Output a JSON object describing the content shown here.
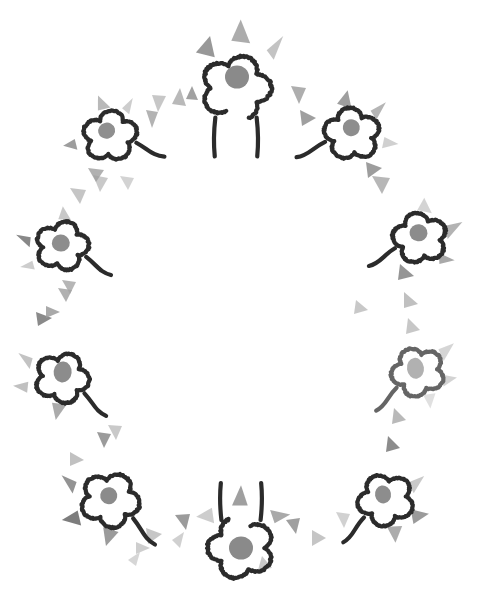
{
  "artwork": {
    "title": "Hand-drawn flower wreath",
    "type": "decorative-illustration",
    "canvas": {
      "width": 489,
      "height": 597,
      "background": "#ffffff"
    },
    "style": {
      "outline_color": "#2b2b2b",
      "outline_width": 4.2,
      "center_dot_color": "#8a8a8a",
      "triangle_color_dark": "#6e6e6e",
      "triangle_color_mid": "#9a9a9a",
      "triangle_color_light": "#c4c4c4"
    },
    "composition": {
      "arrangement": "oval-ring",
      "ring_center_x": 244,
      "ring_center_y": 305,
      "ring_radius_x": 180,
      "ring_radius_y": 245,
      "flower_count": 8,
      "triangle_count": 34
    },
    "flowers": [
      {
        "name": "flower-top-center",
        "cx": 236,
        "cy": 88,
        "scale": 1.18,
        "rotate": 0,
        "opacity": 1,
        "variant": "stemmed",
        "center": {
          "cx": 237,
          "cy": 77,
          "rx": 12,
          "ry": 11.5,
          "color": "#8a8a8a"
        },
        "petal_triangles": [
          {
            "points": "-34,-30 -22,-44 -18,-26",
            "color": "#8d8d8d",
            "opacity": 0.9
          },
          {
            "points": "-4,-40 4,-58 12,-38",
            "color": "#9d9d9d",
            "opacity": 0.85
          },
          {
            "points": "26,-32 40,-44 32,-24",
            "color": "#bdbdbd",
            "opacity": 0.9
          }
        ]
      },
      {
        "name": "flower-upper-left",
        "cx": 110,
        "cy": 136,
        "scale": 0.92,
        "rotate": -14,
        "opacity": 1,
        "variant": "tailed",
        "center": {
          "cx": 108,
          "cy": 130,
          "rx": 8.5,
          "ry": 8,
          "color": "#8f8f8f"
        },
        "petal_triangles": [
          {
            "points": "-38,-6 -52,-2 -38,6",
            "color": "#8c8c8c",
            "opacity": 0.85
          },
          {
            "points": "-6,-30 -2,-46 8,-30",
            "color": "#a8a8a8",
            "opacity": 0.8
          },
          {
            "points": "20,-26 34,-34 26,-18",
            "color": "#bcbcbc",
            "opacity": 0.75
          }
        ]
      },
      {
        "name": "flower-upper-right",
        "cx": 352,
        "cy": 134,
        "scale": 0.95,
        "rotate": 12,
        "opacity": 1,
        "variant": "tailed-mirror",
        "center": {
          "cx": 350,
          "cy": 128,
          "rx": 8.5,
          "ry": 8.5,
          "color": "#8d8d8d"
        },
        "petal_triangles": [
          {
            "points": "-22,-28 -14,-44 -6,-26",
            "color": "#8e8e8e",
            "opacity": 0.85
          },
          {
            "points": "14,-28 28,-40 22,-20",
            "color": "#a2a2a2",
            "opacity": 0.8
          },
          {
            "points": "34,-4 50,0 34,8",
            "color": "#bcbcbc",
            "opacity": 0.7
          }
        ]
      },
      {
        "name": "flower-left-upper-mid",
        "cx": 62,
        "cy": 246,
        "scale": 0.9,
        "rotate": -4,
        "opacity": 1,
        "variant": "tailed",
        "center": {
          "cx": 61,
          "cy": 243,
          "rx": 9,
          "ry": 8.5,
          "color": "#8d8d8d"
        },
        "petal_triangles": [
          {
            "points": "-34,-12 -50,-16 -36,-1",
            "color": "#7b7b7b",
            "opacity": 0.9
          },
          {
            "points": "-34,14 -48,20 -32,24",
            "color": "#c0c0c0",
            "opacity": 0.8
          },
          {
            "points": "-2,-30 4,-44 12,-28",
            "color": "#b0b0b0",
            "opacity": 0.7
          }
        ]
      },
      {
        "name": "flower-right-upper-mid",
        "cx": 420,
        "cy": 238,
        "scale": 0.92,
        "rotate": 6,
        "opacity": 1,
        "variant": "tailed-mirror",
        "center": {
          "cx": 418,
          "cy": 233,
          "rx": 9,
          "ry": 8.5,
          "color": "#8c8c8c"
        },
        "petal_triangles": [
          {
            "points": "26,-16 44,-22 30,-2",
            "color": "#a6a6a6",
            "opacity": 0.85
          },
          {
            "points": "22,14 40,20 24,26",
            "color": "#9a9a9a",
            "opacity": 0.85
          },
          {
            "points": "-6,-30 0,-44 10,-28",
            "color": "#c2c2c2",
            "opacity": 0.7
          }
        ]
      },
      {
        "name": "flower-left-lower-mid",
        "cx": 62,
        "cy": 378,
        "scale": 0.92,
        "rotate": 6,
        "opacity": 1,
        "variant": "tailed",
        "center": {
          "cx": 62,
          "cy": 372,
          "rx": 9,
          "ry": 10.5,
          "color": "#8c8c8c"
        },
        "petal_triangles": [
          {
            "points": "-34,-18 -50,-22 -36,-6",
            "color": "#b4b4b4",
            "opacity": 0.8
          },
          {
            "points": "-36,8 -52,14 -36,20",
            "color": "#b0b0b0",
            "opacity": 0.8
          },
          {
            "points": "-8,28 -2,46 8,28",
            "color": "#9c9c9c",
            "opacity": 0.85
          }
        ]
      },
      {
        "name": "flower-right-lower-mid",
        "cx": 418,
        "cy": 372,
        "scale": 0.9,
        "rotate": -8,
        "opacity": 0.72,
        "variant": "tailed-mirror",
        "center": {
          "cx": 416,
          "cy": 368,
          "rx": 8.5,
          "ry": 10.5,
          "color": "#949494"
        },
        "petal_triangles": [
          {
            "points": "26,-22 44,-26 30,-8",
            "color": "#b8b8b8",
            "opacity": 0.8
          },
          {
            "points": "24,6 42,12 26,20",
            "color": "#b4b4b4",
            "opacity": 0.8
          },
          {
            "points": "2,26 8,42 16,26",
            "color": "#c2c2c2",
            "opacity": 0.7
          }
        ]
      },
      {
        "name": "flower-lower-left",
        "cx": 110,
        "cy": 500,
        "scale": 1.0,
        "rotate": 10,
        "opacity": 1,
        "variant": "tailed",
        "center": {
          "cx": 108,
          "cy": 496,
          "rx": 8.5,
          "ry": 8.5,
          "color": "#8b8b8b"
        },
        "petal_triangles": [
          {
            "points": "-36,-12 -52,-16 -38,0",
            "color": "#878787",
            "opacity": 0.9
          },
          {
            "points": "-30,16 -44,28 -24,30",
            "color": "#6f6f6f",
            "opacity": 0.9
          },
          {
            "points": "-2,28 4,46 14,30",
            "color": "#8a8a8a",
            "opacity": 0.85
          }
        ]
      },
      {
        "name": "flower-lower-right",
        "cx": 386,
        "cy": 500,
        "scale": 0.95,
        "rotate": -10,
        "opacity": 1,
        "variant": "tailed-mirror",
        "center": {
          "cx": 384,
          "cy": 494,
          "rx": 8,
          "ry": 9,
          "color": "#8d8d8d"
        },
        "petal_triangles": [
          {
            "points": "26,-14 44,-18 30,-2",
            "color": "#bcbcbc",
            "opacity": 0.8
          },
          {
            "points": "24,14 42,22 24,30",
            "color": "#8a8a8a",
            "opacity": 0.85
          },
          {
            "points": "-4,28 2,46 12,30",
            "color": "#9e9e9e",
            "opacity": 0.85
          }
        ]
      },
      {
        "name": "flower-bottom-center",
        "cx": 241,
        "cy": 548,
        "scale": 1.12,
        "rotate": 180,
        "opacity": 1,
        "variant": "stemmed",
        "center": {
          "cx": 241,
          "cy": 548,
          "rx": 12,
          "ry": 11.5,
          "color": "#8a8a8a"
        },
        "petal_triangles": [
          {
            "points": "-30,22 -44,30 -26,34",
            "color": "#9a9a9a",
            "opacity": 0.85
          },
          {
            "points": "-6,38 0,56 8,38",
            "color": "#8e8e8e",
            "opacity": 0.85
          },
          {
            "points": "24,22 40,28 26,36",
            "color": "#c0c0c0",
            "opacity": 0.8
          }
        ]
      }
    ],
    "scatter_triangles": [
      {
        "points": "152,95 158,112 166,96",
        "color": "#bdbdbd",
        "opacity": 0.85,
        "name": "scatter-1"
      },
      {
        "points": "172,104 180,88 186,106",
        "color": "#a8a8a8",
        "opacity": 0.8,
        "name": "scatter-2"
      },
      {
        "points": "291,86 299,104 306,88",
        "color": "#a0a0a0",
        "opacity": 0.85,
        "name": "scatter-3"
      },
      {
        "points": "146,110 152,128 158,112",
        "color": "#9a9a9a",
        "opacity": 0.75,
        "name": "scatter-4"
      },
      {
        "points": "300,110 316,118 302,126",
        "color": "#8e8e8e",
        "opacity": 0.85,
        "name": "scatter-5"
      },
      {
        "points": "93,175 100,192 108,178",
        "color": "#bcbcbc",
        "opacity": 0.8,
        "name": "scatter-6"
      },
      {
        "points": "88,168 96,182 104,170",
        "color": "#9e9e9e",
        "opacity": 0.8,
        "name": "scatter-7"
      },
      {
        "points": "372,176 382,194 390,178",
        "color": "#aaaaaa",
        "opacity": 0.85,
        "name": "scatter-8"
      },
      {
        "points": "366,162 382,168 368,178",
        "color": "#8c8c8c",
        "opacity": 0.85,
        "name": "scatter-9"
      },
      {
        "points": "70,188 80,204 86,190",
        "color": "#b6b6b6",
        "opacity": 0.8,
        "name": "scatter-10"
      },
      {
        "points": "400,264 414,276 398,280",
        "color": "#8a8a8a",
        "opacity": 0.9,
        "name": "scatter-11"
      },
      {
        "points": "404,292 418,304 404,308",
        "color": "#b0b0b0",
        "opacity": 0.8,
        "name": "scatter-12"
      },
      {
        "points": "58,288 66,302 72,290",
        "color": "#9e9e9e",
        "opacity": 0.8,
        "name": "scatter-13"
      },
      {
        "points": "36,312 52,318 38,326",
        "color": "#7d7d7d",
        "opacity": 0.9,
        "name": "scatter-14"
      },
      {
        "points": "408,318 420,330 406,334",
        "color": "#b4b4b4",
        "opacity": 0.75,
        "name": "scatter-15"
      },
      {
        "points": "108,425 116,440 122,426",
        "color": "#bcbcbc",
        "opacity": 0.8,
        "name": "scatter-16"
      },
      {
        "points": "97,432 104,448 111,434",
        "color": "#8a8a8a",
        "opacity": 0.85,
        "name": "scatter-17"
      },
      {
        "points": "70,452 84,460 70,466",
        "color": "#b2b2b2",
        "opacity": 0.8,
        "name": "scatter-18"
      },
      {
        "points": "388,436 400,448 386,452",
        "color": "#7f7f7f",
        "opacity": 0.9,
        "name": "scatter-19"
      },
      {
        "points": "394,408 406,420 392,424",
        "color": "#a8a8a8",
        "opacity": 0.8,
        "name": "scatter-20"
      },
      {
        "points": "146,528 162,534 148,544",
        "color": "#b8b8b8",
        "opacity": 0.8,
        "name": "scatter-21"
      },
      {
        "points": "175,515 186,530 190,514",
        "color": "#8a8a8a",
        "opacity": 0.85,
        "name": "scatter-22"
      },
      {
        "points": "172,540 184,532 180,548",
        "color": "#c0c0c0",
        "opacity": 0.75,
        "name": "scatter-23"
      },
      {
        "points": "286,520 296,534 300,518",
        "color": "#8e8e8e",
        "opacity": 0.85,
        "name": "scatter-24"
      },
      {
        "points": "312,530 326,538 312,546",
        "color": "#b6b6b6",
        "opacity": 0.8,
        "name": "scatter-25"
      },
      {
        "points": "336,512 344,528 350,514",
        "color": "#c2c2c2",
        "opacity": 0.75,
        "name": "scatter-26"
      },
      {
        "points": "136,542 150,548 136,554",
        "color": "#bebebe",
        "opacity": 0.75,
        "name": "scatter-27"
      },
      {
        "points": "46,306 60,312 46,318",
        "color": "#9a9a9a",
        "opacity": 0.85,
        "name": "scatter-28"
      },
      {
        "points": "62,280 70,294 76,282",
        "color": "#a4a4a4",
        "opacity": 0.8,
        "name": "scatter-29"
      },
      {
        "points": "186,99 192,86 198,100",
        "color": "#8a8a8a",
        "opacity": 0.8,
        "name": "scatter-30"
      },
      {
        "points": "262,556 272,568 258,570",
        "color": "#b8b8b8",
        "opacity": 0.75,
        "name": "scatter-31"
      },
      {
        "points": "120,176 128,190 134,178",
        "color": "#c0c0c0",
        "opacity": 0.7,
        "name": "scatter-32"
      },
      {
        "points": "356,300 368,310 354,314",
        "color": "#b0b0b0",
        "opacity": 0.7,
        "name": "scatter-33"
      },
      {
        "points": "128,560 140,552 136,566",
        "color": "#c4c4c4",
        "opacity": 0.7,
        "name": "scatter-34"
      }
    ]
  }
}
